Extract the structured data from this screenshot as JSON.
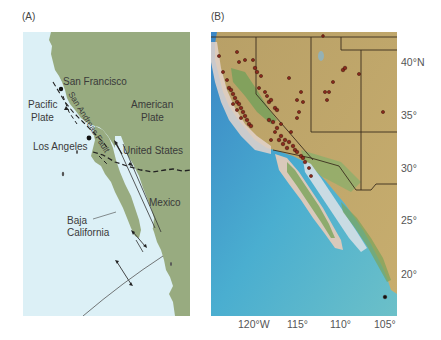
{
  "panel_a": {
    "label": "(A)",
    "land_color": "#98ab80",
    "ocean_color": "#dcf0f6",
    "places": {
      "san_francisco": "San Francisco",
      "pacific_plate_1": "Pacific",
      "pacific_plate_2": "Plate",
      "american_plate_1": "American",
      "american_plate_2": "Plate",
      "los_angeles": "Los Angeles",
      "united_states": "United States",
      "mexico": "Mexico",
      "baja_1": "Baja",
      "baja_2": "California",
      "san_andreas_fault": "San Andreas Fault"
    }
  },
  "panel_b": {
    "label": "(B)",
    "latitude_labels": [
      "40°N",
      "35°",
      "30°",
      "25°",
      "20°"
    ],
    "longitude_labels": [
      "120°W",
      "115°",
      "110°",
      "105°"
    ],
    "earthquake_marker_color": "#8a2a1c"
  }
}
